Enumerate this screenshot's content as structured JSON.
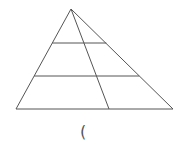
{
  "diagram": {
    "type": "triangle-with-cevian-and-parallels",
    "apex": [
      71,
      9
    ],
    "base_left": [
      16,
      109
    ],
    "base_right": [
      173,
      109
    ],
    "cevian_end": [
      109,
      109
    ],
    "parallel_lines_y": [
      43,
      76
    ],
    "stroke_color": "#555555"
  },
  "caption": "("
}
